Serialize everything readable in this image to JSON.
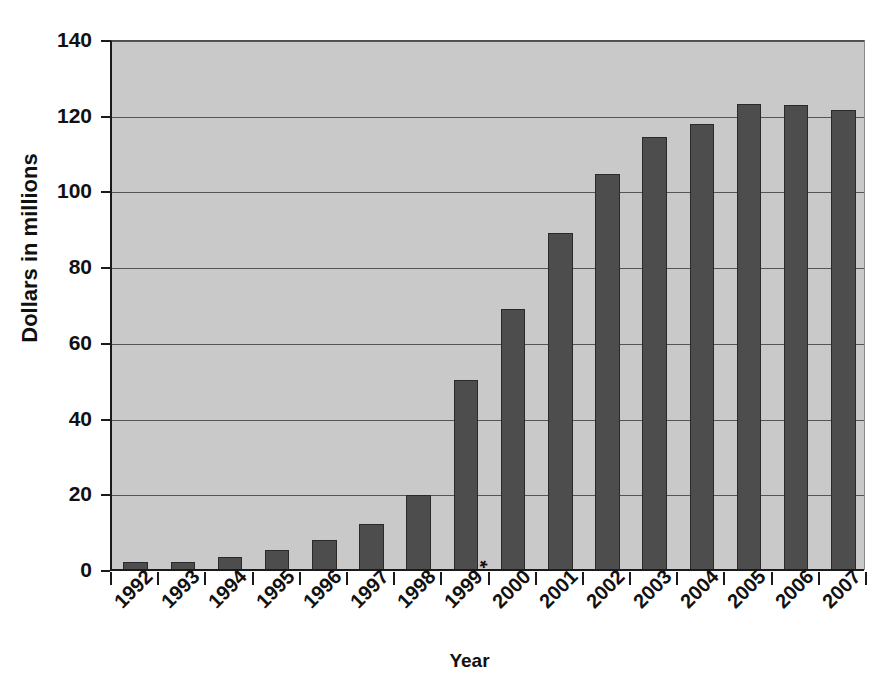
{
  "chart_data": {
    "type": "bar",
    "title": "",
    "subtitle": "",
    "xlabel": "Year",
    "ylabel": "Dollars in millions",
    "categories": [
      "1992",
      "1993",
      "1994",
      "1995",
      "1996",
      "1997",
      "1998",
      "1999 *",
      "2000",
      "2001",
      "2002",
      "2003",
      "2004",
      "2005",
      "2006",
      "2007"
    ],
    "values": [
      2.2,
      2.1,
      3.5,
      5.3,
      7.9,
      12.2,
      19.8,
      50.3,
      69.0,
      89.0,
      104.5,
      114.3,
      117.7,
      123.2,
      122.8,
      121.5
    ],
    "ylim": [
      0,
      140
    ],
    "ytick_labels": [
      "0",
      "20",
      "40",
      "60",
      "80",
      "100",
      "120",
      "140"
    ],
    "ytick_values": [
      0,
      20,
      40,
      60,
      80,
      100,
      120,
      140
    ],
    "grid": true,
    "legend": "none",
    "footnote_marker": "*",
    "colors": {
      "bar_fill": "#4d4d4d",
      "bar_border": "#2a2a2a",
      "plot_background": "#c9c9c9",
      "axis": "#1a1a1a",
      "gridline": "#555555",
      "text": "#111111",
      "page_background": "#ffffff"
    }
  }
}
